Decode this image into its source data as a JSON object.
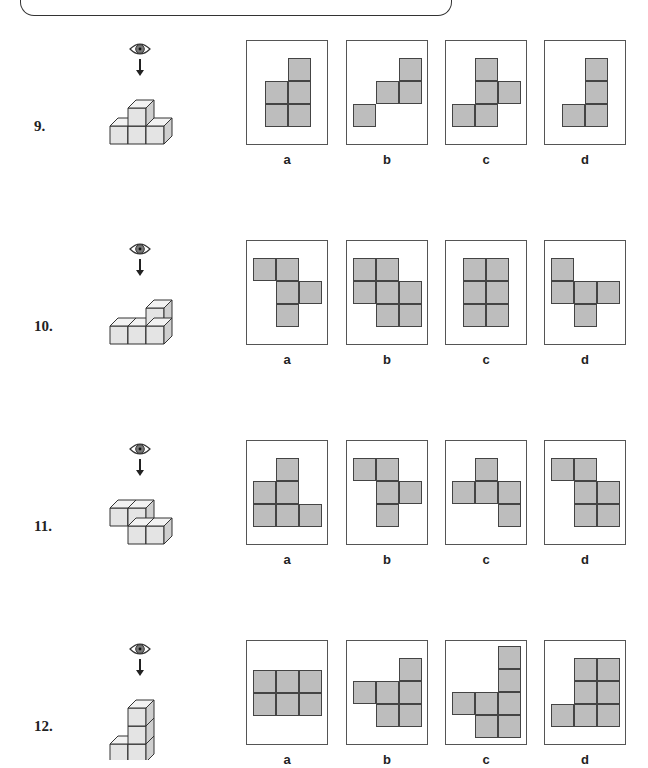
{
  "worksheet": {
    "questions": [
      {
        "number": "9.",
        "top": 40,
        "options": [
          {
            "label": "a",
            "cells": [
              [
                41,
                17
              ],
              [
                18,
                40
              ],
              [
                41,
                40
              ],
              [
                18,
                63
              ],
              [
                41,
                63
              ]
            ]
          },
          {
            "label": "b",
            "cells": [
              [
                52,
                17
              ],
              [
                29,
                40
              ],
              [
                52,
                40
              ],
              [
                6,
                63
              ]
            ]
          },
          {
            "label": "c",
            "cells": [
              [
                29,
                17
              ],
              [
                29,
                40
              ],
              [
                52,
                40
              ],
              [
                6,
                63
              ],
              [
                29,
                63
              ]
            ]
          },
          {
            "label": "d",
            "cells": [
              [
                40,
                17
              ],
              [
                40,
                40
              ],
              [
                17,
                63
              ],
              [
                40,
                63
              ]
            ]
          }
        ]
      },
      {
        "number": "10.",
        "top": 240,
        "options": [
          {
            "label": "a",
            "cells": [
              [
                6,
                17
              ],
              [
                29,
                17
              ],
              [
                29,
                40
              ],
              [
                52,
                40
              ],
              [
                29,
                63
              ]
            ]
          },
          {
            "label": "b",
            "cells": [
              [
                6,
                17
              ],
              [
                29,
                17
              ],
              [
                6,
                40
              ],
              [
                29,
                40
              ],
              [
                52,
                40
              ],
              [
                29,
                63
              ],
              [
                52,
                63
              ]
            ]
          },
          {
            "label": "c",
            "cells": [
              [
                17,
                17
              ],
              [
                40,
                17
              ],
              [
                17,
                40
              ],
              [
                40,
                40
              ],
              [
                17,
                63
              ],
              [
                40,
                63
              ]
            ]
          },
          {
            "label": "d",
            "cells": [
              [
                6,
                17
              ],
              [
                6,
                40
              ],
              [
                29,
                40
              ],
              [
                52,
                40
              ],
              [
                29,
                63
              ]
            ]
          }
        ]
      },
      {
        "number": "11.",
        "top": 440,
        "options": [
          {
            "label": "a",
            "cells": [
              [
                29,
                17
              ],
              [
                6,
                40
              ],
              [
                29,
                40
              ],
              [
                6,
                63
              ],
              [
                29,
                63
              ],
              [
                52,
                63
              ]
            ]
          },
          {
            "label": "b",
            "cells": [
              [
                6,
                17
              ],
              [
                29,
                17
              ],
              [
                29,
                40
              ],
              [
                52,
                40
              ],
              [
                29,
                63
              ]
            ]
          },
          {
            "label": "c",
            "cells": [
              [
                29,
                17
              ],
              [
                6,
                40
              ],
              [
                29,
                40
              ],
              [
                52,
                40
              ],
              [
                52,
                63
              ]
            ]
          },
          {
            "label": "d",
            "cells": [
              [
                6,
                17
              ],
              [
                29,
                17
              ],
              [
                29,
                40
              ],
              [
                52,
                40
              ],
              [
                29,
                63
              ],
              [
                52,
                63
              ]
            ]
          }
        ]
      },
      {
        "number": "12.",
        "top": 640,
        "options": [
          {
            "label": "a",
            "cells": [
              [
                6,
                29
              ],
              [
                29,
                29
              ],
              [
                52,
                29
              ],
              [
                6,
                52
              ],
              [
                29,
                52
              ],
              [
                52,
                52
              ]
            ]
          },
          {
            "label": "b",
            "cells": [
              [
                52,
                17
              ],
              [
                6,
                40
              ],
              [
                29,
                40
              ],
              [
                52,
                40
              ],
              [
                29,
                63
              ],
              [
                52,
                63
              ]
            ]
          },
          {
            "label": "c",
            "cells": [
              [
                52,
                5
              ],
              [
                52,
                28
              ],
              [
                6,
                51
              ],
              [
                29,
                51
              ],
              [
                52,
                51
              ],
              [
                29,
                74
              ],
              [
                52,
                74
              ]
            ]
          },
          {
            "label": "d",
            "cells": [
              [
                29,
                17
              ],
              [
                52,
                17
              ],
              [
                29,
                40
              ],
              [
                52,
                40
              ],
              [
                6,
                63
              ],
              [
                29,
                63
              ],
              [
                52,
                63
              ]
            ]
          }
        ]
      }
    ],
    "box_x": [
      246,
      346,
      445,
      544
    ],
    "icons": {
      "viewpoint": "eye-icon",
      "direction": "arrow-down-icon"
    },
    "colors": {
      "cell_fill": "#bdbdbd",
      "cell_border": "#444444",
      "cube_face": "#e4e4e4",
      "cube_side": "#cfcfcf"
    }
  }
}
